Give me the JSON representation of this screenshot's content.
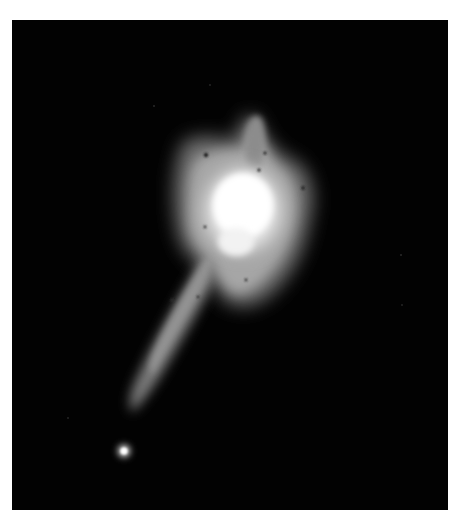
{
  "image": {
    "subject": "nebula with jet and star",
    "background_color": "#020202",
    "page_background": "#ffffff",
    "frame": {
      "x": 12,
      "y": 20,
      "width": 436,
      "height": 490
    }
  },
  "features": {
    "nebula_core": {
      "cx": 243,
      "cy": 207,
      "color": "#ffffff"
    },
    "nebula_halo": {
      "left": 175,
      "right": 315,
      "top": 140,
      "bottom": 305
    },
    "top_spike": {
      "x": 253,
      "y_top": 114
    },
    "jet": {
      "start": [
        215,
        250
      ],
      "end": [
        133,
        405
      ]
    },
    "star": {
      "cx": 124,
      "cy": 451,
      "color": "#ffffff"
    }
  }
}
